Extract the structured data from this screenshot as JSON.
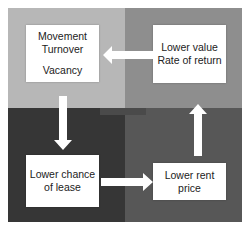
{
  "diagram": {
    "type": "cycle",
    "colors": {
      "top_left": "#b7b7b7",
      "top_right": "#8e8e8e",
      "bottom_left": "#363636",
      "bottom_right": "#575757",
      "box": "#ffffff",
      "arrow": "#ffffff"
    },
    "nodes": {
      "top_left": {
        "line1": "Movement",
        "line2": "Turnover",
        "line3": "Vacancy"
      },
      "top_right": {
        "line1": "Lower value",
        "line2": "Rate of return"
      },
      "bottom_left": {
        "line1": "Lower chance",
        "line2": "of lease"
      },
      "bottom_right": {
        "line1": "Lower rent",
        "line2": "price"
      }
    },
    "arrows": [
      {
        "from": "top_right",
        "to": "top_left",
        "direction": "left"
      },
      {
        "from": "top_left",
        "to": "bottom_left",
        "direction": "down"
      },
      {
        "from": "bottom_left",
        "to": "bottom_right",
        "direction": "right"
      },
      {
        "from": "bottom_right",
        "to": "top_right",
        "direction": "up"
      }
    ]
  }
}
